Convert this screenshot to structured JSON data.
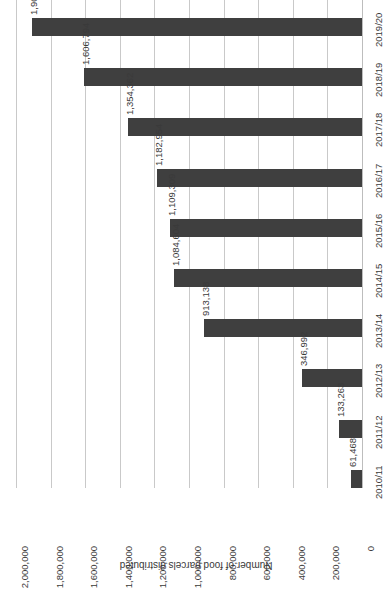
{
  "chart_data": {
    "type": "bar",
    "orientation": "horizontal",
    "title": "",
    "subtitle": "",
    "xlabel": "Number of food parcels distributed",
    "ylabel": "",
    "categories": [
      "2010/11",
      "2011/12",
      "2012/13",
      "2013/14",
      "2014/15",
      "2015/16",
      "2016/17",
      "2017/18",
      "2018/19",
      "2019/20"
    ],
    "values": [
      61468,
      133263,
      346992,
      913138,
      1084604,
      1109309,
      1182954,
      1354362,
      1606794,
      1909388
    ],
    "data_labels": [
      "61,468",
      "133,263",
      "346,992",
      "913,138",
      "1,084,604",
      "1,109,309",
      "1,182,954",
      "1,354,362",
      "1,606,794",
      "1,909,388"
    ],
    "series": [
      {
        "name": "Number of food parcels distributed",
        "values": [
          61468,
          133263,
          346992,
          913138,
          1084604,
          1109309,
          1182954,
          1354362,
          1606794,
          1909388
        ]
      }
    ],
    "xlim": [
      0,
      2000000
    ],
    "tick_values": [
      0,
      200000,
      400000,
      600000,
      800000,
      1000000,
      1200000,
      1400000,
      1600000,
      1800000,
      2000000
    ],
    "tick_labels": [
      "0",
      "200,000",
      "400,000",
      "600,000",
      "800,000",
      "1,000,000",
      "1,200,000",
      "1,400,000",
      "1,600,000",
      "1,800,000",
      "2,000,000"
    ],
    "grid": true,
    "legend": false,
    "legend_position": "none",
    "bar_color": "#3f3f3f",
    "gridline_color": "#c9c9c9",
    "background_color": "#ffffff",
    "rotation_note": "entire plot rendered rotated 90 degrees; value axis increases right-to-left"
  },
  "axis": {
    "title": "Number of food parcels distributed"
  }
}
